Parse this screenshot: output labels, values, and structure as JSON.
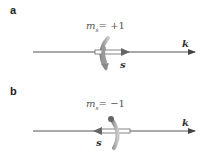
{
  "panels": [
    {
      "label": "a",
      "quantum_number": "m",
      "subscript": "s",
      "equation_rhs": "= +1",
      "axis_label": "k",
      "spin_label": "s",
      "spin_direction": "right"
    },
    {
      "label": "b",
      "quantum_number": "m",
      "subscript": "s",
      "equation_rhs": "= −1",
      "axis_label": "k",
      "spin_label": "s",
      "spin_direction": "left"
    }
  ],
  "colors": {
    "axis": "#555555",
    "spin_arrow": "#777777",
    "rotation_arrow": "#9a9a9a"
  }
}
